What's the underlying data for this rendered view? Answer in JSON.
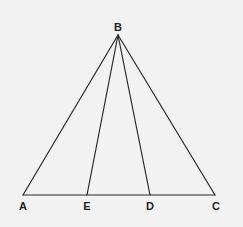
{
  "diagram": {
    "type": "triangle-with-cevians",
    "background_color": "#f2f2f2",
    "line_color": "#2a2a2a",
    "points": {
      "B": {
        "label": "B",
        "x": 118,
        "y": 35,
        "label_x": 118,
        "label_y": 31
      },
      "A": {
        "label": "A",
        "x": 23,
        "y": 195,
        "label_x": 23,
        "label_y": 210
      },
      "E": {
        "label": "E",
        "x": 87,
        "y": 195,
        "label_x": 87,
        "label_y": 210
      },
      "D": {
        "label": "D",
        "x": 150,
        "y": 195,
        "label_x": 150,
        "label_y": 210
      },
      "C": {
        "label": "C",
        "x": 215,
        "y": 195,
        "label_x": 216,
        "label_y": 210
      }
    },
    "segments": [
      {
        "from": "B",
        "to": "A"
      },
      {
        "from": "B",
        "to": "E"
      },
      {
        "from": "B",
        "to": "D"
      },
      {
        "from": "B",
        "to": "C"
      },
      {
        "from": "A",
        "to": "C"
      }
    ]
  }
}
